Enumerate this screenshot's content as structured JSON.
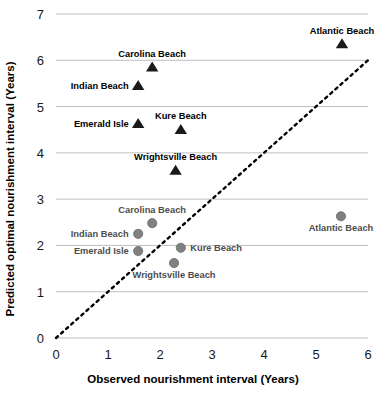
{
  "chart_data": {
    "type": "scatter",
    "title": "",
    "xlabel": "Observed nourishment interval (Years)",
    "ylabel": "Predicted optimal nourishment interval (Years)",
    "xlim": [
      0,
      6
    ],
    "ylim": [
      0,
      7
    ],
    "xticks": [
      "0",
      "1",
      "2",
      "3",
      "4",
      "5",
      "6"
    ],
    "yticks": [
      "0",
      "1",
      "2",
      "3",
      "4",
      "5",
      "6",
      "7"
    ],
    "grid": "horizontal",
    "legend": "none",
    "annotations": [
      {
        "name": "one-to-one-line",
        "style": "dotted",
        "from": [
          0,
          0
        ],
        "to": [
          6,
          6
        ],
        "color": "#000000"
      }
    ],
    "series": [
      {
        "name": "Predicted optimal (triangles)",
        "marker": "triangle",
        "color": "#1a1a1a",
        "points": [
          {
            "label": "Atlantic Beach",
            "x": 5.5,
            "y": 6.35,
            "label_pos": "above"
          },
          {
            "label": "Carolina Beach",
            "x": 1.85,
            "y": 5.85,
            "label_pos": "above"
          },
          {
            "label": "Indian Beach",
            "x": 1.58,
            "y": 5.45,
            "label_pos": "left"
          },
          {
            "label": "Emerald Isle",
            "x": 1.58,
            "y": 4.63,
            "label_pos": "left"
          },
          {
            "label": "Kure Beach",
            "x": 2.4,
            "y": 4.5,
            "label_pos": "above"
          },
          {
            "label": "Wrightsville Beach",
            "x": 2.3,
            "y": 3.62,
            "label_pos": "above"
          }
        ]
      },
      {
        "name": "Observed interval (circles)",
        "marker": "circle",
        "color": "#808080",
        "points": [
          {
            "label": "Atlantic Beach",
            "x": 5.48,
            "y": 2.63,
            "label_pos": "below"
          },
          {
            "label": "Carolina Beach",
            "x": 1.85,
            "y": 2.48,
            "label_pos": "above"
          },
          {
            "label": "Indian Beach",
            "x": 1.58,
            "y": 2.25,
            "label_pos": "left"
          },
          {
            "label": "Emerald Isle",
            "x": 1.58,
            "y": 1.88,
            "label_pos": "left"
          },
          {
            "label": "Kure Beach",
            "x": 2.4,
            "y": 1.95,
            "label_pos": "right"
          },
          {
            "label": "Wrightsville Beach",
            "x": 2.27,
            "y": 1.62,
            "label_pos": "below"
          }
        ]
      }
    ]
  },
  "colors": {
    "triangle": "#1a1a1a",
    "circle": "#808080",
    "gridline": "#bfbfbf",
    "oneone_line": "#000000",
    "background": "#ffffff"
  }
}
